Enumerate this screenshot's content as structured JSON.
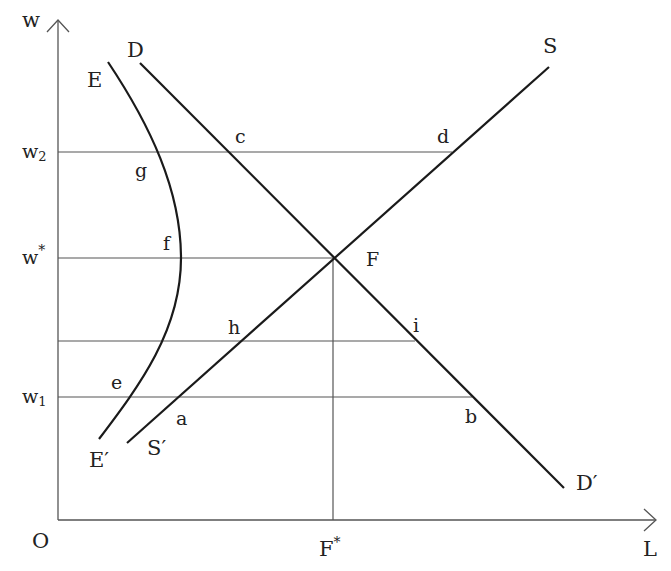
{
  "diagram": {
    "axes": {
      "y_label": "w",
      "x_label": "L",
      "origin_label": "O",
      "origin": [
        58,
        520
      ],
      "y_top": 20,
      "x_right": 656
    },
    "y_ticks": [
      {
        "id": "w2",
        "base": "w",
        "sub": "2",
        "sup": "",
        "y": 152
      },
      {
        "id": "wstar",
        "base": "w",
        "sub": "",
        "sup": "*",
        "y": 258
      },
      {
        "id": "w1",
        "base": "w",
        "sub": "1",
        "sup": "",
        "y": 397
      }
    ],
    "x_ticks": [
      {
        "id": "Fstar",
        "base": "F",
        "sup": "*",
        "x": 333
      }
    ],
    "guide_lines": [
      {
        "name": "w2-line",
        "from": [
          58,
          152
        ],
        "to": [
          452,
          152
        ]
      },
      {
        "name": "wstar-line",
        "from": [
          58,
          258
        ],
        "to": [
          333,
          258
        ]
      },
      {
        "name": "mid-line",
        "from": [
          58,
          341
        ],
        "to": [
          415,
          341
        ]
      },
      {
        "name": "w1-line",
        "from": [
          58,
          397
        ],
        "to": [
          472,
          397
        ]
      },
      {
        "name": "fstar-vertical",
        "from": [
          333,
          258
        ],
        "to": [
          333,
          520
        ]
      }
    ],
    "curves": {
      "demand": {
        "label_start": "D",
        "label_end": "D′",
        "from": [
          140,
          63
        ],
        "to": [
          564,
          488
        ]
      },
      "supply": {
        "label_start": "S′",
        "label_end": "S",
        "from": [
          127,
          443
        ],
        "to": [
          549,
          67
        ]
      },
      "effort": {
        "label_start": "E",
        "label_end": "E′",
        "path": "M108,62 C150,125 181,190 181,258 C181,330 140,385 99,439"
      }
    },
    "points": [
      {
        "id": "c",
        "label": "c",
        "x": 235,
        "y": 143
      },
      {
        "id": "d",
        "label": "d",
        "x": 437,
        "y": 143
      },
      {
        "id": "g",
        "label": "g",
        "x": 135,
        "y": 177
      },
      {
        "id": "f",
        "label": "f",
        "x": 163,
        "y": 250
      },
      {
        "id": "F",
        "label": "F",
        "x": 366,
        "y": 266
      },
      {
        "id": "h",
        "label": "h",
        "x": 228,
        "y": 334
      },
      {
        "id": "i",
        "label": "i",
        "x": 413,
        "y": 332
      },
      {
        "id": "e",
        "label": "e",
        "x": 111,
        "y": 389
      },
      {
        "id": "a",
        "label": "a",
        "x": 176,
        "y": 425
      },
      {
        "id": "b",
        "label": "b",
        "x": 465,
        "y": 423
      }
    ],
    "curve_labels": [
      {
        "id": "D",
        "label": "D",
        "x": 127,
        "y": 57
      },
      {
        "id": "E",
        "label": "E",
        "x": 87,
        "y": 87
      },
      {
        "id": "S",
        "label": "S",
        "x": 543,
        "y": 53
      },
      {
        "id": "Sprime",
        "label": "S′",
        "x": 147,
        "y": 455
      },
      {
        "id": "Eprime",
        "label": "E′",
        "x": 89,
        "y": 467
      },
      {
        "id": "Dprime",
        "label": "D′",
        "x": 576,
        "y": 490
      }
    ]
  }
}
